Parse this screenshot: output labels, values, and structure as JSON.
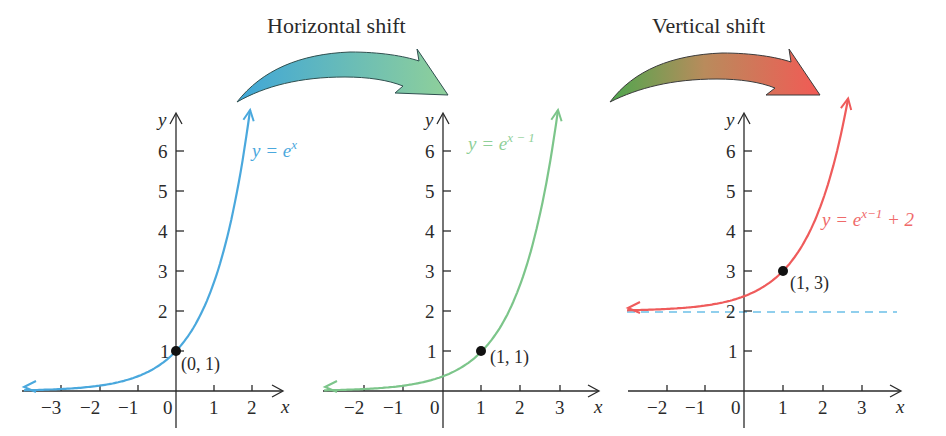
{
  "titles": {
    "horizontal": "Horizontal shift",
    "vertical": "Vertical shift"
  },
  "colors": {
    "blue": "#4aa8dd",
    "green": "#7cc58a",
    "red": "#ef5b5b",
    "axis": "#2a2a2a",
    "asymptote": "#6cc0e8"
  },
  "axis_labels": {
    "x": "x",
    "y": "y"
  },
  "chart_data": [
    {
      "type": "line",
      "title": "",
      "series": [
        {
          "name": "y = e^x",
          "function": "e^x",
          "color": "#4aa8dd"
        }
      ],
      "x_ticks": [
        -3,
        -2,
        -1,
        0,
        1,
        2
      ],
      "y_ticks": [
        1,
        2,
        3,
        4,
        5,
        6
      ],
      "xlabel": "x",
      "ylabel": "y",
      "xlim": [
        -4,
        2.7
      ],
      "ylim": [
        -0.6,
        7
      ],
      "points": [
        {
          "x": 0,
          "y": 1,
          "label": "(0, 1)"
        }
      ],
      "equation_label": {
        "base": "y = e",
        "exponent": "x"
      },
      "grid": false
    },
    {
      "type": "line",
      "title": "",
      "series": [
        {
          "name": "y = e^(x-1)",
          "function": "e^(x-1)",
          "color": "#7cc58a"
        }
      ],
      "x_ticks": [
        -2,
        -1,
        0,
        1,
        2,
        3
      ],
      "y_ticks": [
        1,
        2,
        3,
        4,
        5,
        6
      ],
      "xlabel": "x",
      "ylabel": "y",
      "xlim": [
        -3,
        3.7
      ],
      "ylim": [
        -0.6,
        7
      ],
      "points": [
        {
          "x": 1,
          "y": 1,
          "label": "(1, 1)"
        }
      ],
      "equation_label": {
        "base": "y = e",
        "exponent": "x − 1"
      },
      "grid": false
    },
    {
      "type": "line",
      "title": "",
      "series": [
        {
          "name": "y = e^(x-1) + 2",
          "function": "e^(x-1) + 2",
          "color": "#ef5b5b"
        }
      ],
      "x_ticks": [
        -2,
        -1,
        0,
        1,
        2,
        3
      ],
      "y_ticks": [
        1,
        2,
        3,
        4,
        5,
        6
      ],
      "xlabel": "x",
      "ylabel": "y",
      "xlim": [
        -3,
        3.7
      ],
      "ylim": [
        -0.6,
        7
      ],
      "points": [
        {
          "x": 1,
          "y": 3,
          "label": "(1, 3)"
        }
      ],
      "asymptote": {
        "y": 2,
        "style": "dashed"
      },
      "equation_label": {
        "base": "y = e",
        "exponent": "x−1",
        "suffix": " + 2"
      },
      "grid": false
    }
  ],
  "tick_text": {
    "neg3": "−3",
    "neg2": "−2",
    "neg1": "−1",
    "zero": "0",
    "one": "1",
    "two": "2",
    "three": "3",
    "four": "4",
    "five": "5",
    "six": "6"
  }
}
